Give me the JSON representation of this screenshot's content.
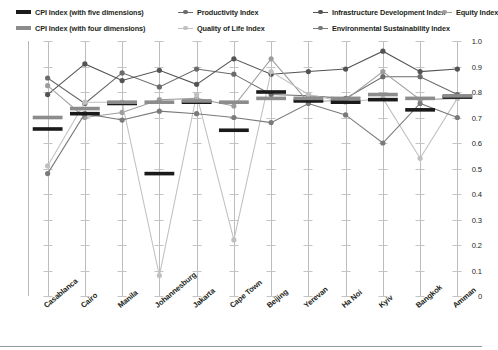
{
  "legend": {
    "items": [
      {
        "label": "CPI Index (with five dimensions)",
        "type": "bar",
        "color": "#1a1a1a",
        "row": 0,
        "col": 0
      },
      {
        "label": "Productivity Index",
        "type": "line",
        "color": "#6b6b6b",
        "row": 0,
        "col": 1
      },
      {
        "label": "Infrastructure Development Index",
        "type": "line",
        "color": "#545454",
        "row": 0,
        "col": 2
      },
      {
        "label": "Equity Index",
        "type": "line",
        "color": "#9d9d9d",
        "row": 0,
        "col": 3
      },
      {
        "label": "CPI Index (with four dimensions)",
        "type": "bar",
        "color": "#8c8c8c",
        "row": 1,
        "col": 0
      },
      {
        "label": "Quality of Life Index",
        "type": "line",
        "color": "#c0c0c0",
        "row": 1,
        "col": 1
      },
      {
        "label": "Environmental Sustainability Index",
        "type": "line",
        "color": "#7a7a7a",
        "row": 1,
        "col": 2
      }
    ]
  },
  "chart_data": {
    "type": "line",
    "title": "",
    "xlabel": "",
    "ylabel": "",
    "ylim": [
      0,
      1.0
    ],
    "ytick_labels": [
      "1.0",
      "0.9",
      "0.8",
      "0.7",
      "0.6",
      "0.5",
      "0.4",
      "0.3",
      "0.2",
      "0.1",
      "0"
    ],
    "yticks": [
      1.0,
      0.9,
      0.8,
      0.7,
      0.6,
      0.5,
      0.4,
      0.3,
      0.2,
      0.1,
      0
    ],
    "grid": false,
    "legend_position": "top",
    "categories": [
      "Casablanca",
      "Cairo",
      "Manila",
      "Johannesburg",
      "Jakarta",
      "Cape Town",
      "Beijing",
      "Yerevan",
      "Ha Noi",
      "Kyiv",
      "Bangkok",
      "Amman"
    ],
    "series": [
      {
        "name": "CPI Index (with five dimensions)",
        "type": "bar",
        "color": "#1a1a1a",
        "values": [
          0.655,
          0.715,
          0.755,
          0.48,
          0.76,
          0.65,
          0.8,
          0.765,
          0.76,
          0.77,
          0.73,
          0.78
        ]
      },
      {
        "name": "CPI Index (with four dimensions)",
        "type": "bar",
        "color": "#8c8c8c",
        "values": [
          0.7,
          0.735,
          0.76,
          0.76,
          0.765,
          0.76,
          0.775,
          0.775,
          0.775,
          0.79,
          0.775,
          0.785
        ]
      },
      {
        "name": "Productivity Index",
        "type": "line",
        "color": "#6b6b6b",
        "values": [
          0.855,
          0.755,
          0.875,
          0.82,
          0.89,
          0.87,
          0.79,
          0.785,
          0.775,
          0.86,
          0.86,
          0.79
        ]
      },
      {
        "name": "Infrastructure Development Index",
        "type": "line",
        "color": "#545454",
        "values": [
          0.79,
          0.91,
          0.845,
          0.885,
          0.83,
          0.93,
          0.87,
          0.88,
          0.89,
          0.96,
          0.88,
          0.89
        ]
      },
      {
        "name": "Equity Index",
        "type": "line",
        "color": "#9d9d9d",
        "values": [
          0.825,
          0.7,
          0.72,
          0.77,
          0.775,
          0.745,
          0.93,
          0.76,
          0.77,
          0.88,
          0.77,
          0.775
        ]
      },
      {
        "name": "Quality of Life Index",
        "type": "line",
        "color": "#c0c0c0",
        "values": [
          0.51,
          0.76,
          0.76,
          0.08,
          0.79,
          0.22,
          0.88,
          0.79,
          0.76,
          0.775,
          0.54,
          0.775
        ]
      },
      {
        "name": "Environmental Sustainability Index",
        "type": "line",
        "color": "#7a7a7a",
        "values": [
          0.48,
          0.715,
          0.69,
          0.725,
          0.715,
          0.7,
          0.68,
          0.755,
          0.71,
          0.6,
          0.755,
          0.7
        ]
      }
    ]
  }
}
